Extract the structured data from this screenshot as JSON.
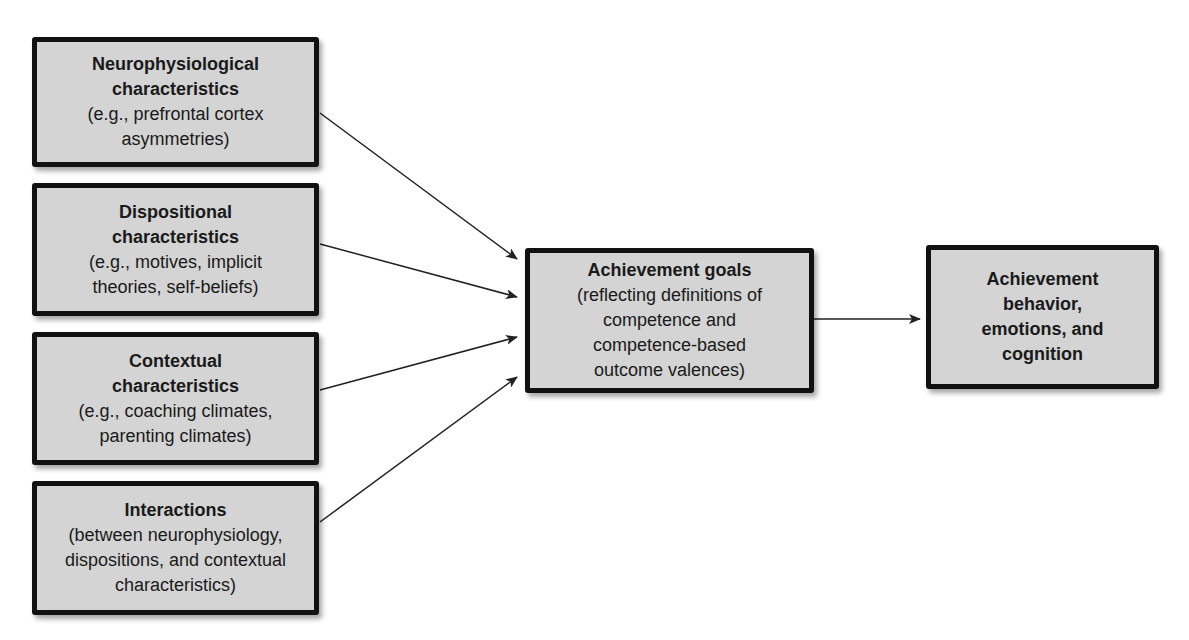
{
  "diagram": {
    "inputs": [
      {
        "title": "Neurophysiological\ncharacteristics",
        "description": "(e.g., prefrontal cortex\nasymmetries)"
      },
      {
        "title": "Dispositional\ncharacteristics",
        "description": "(e.g., motives, implicit\ntheories, self-beliefs)"
      },
      {
        "title": "Contextual\ncharacteristics",
        "description": "(e.g., coaching climates,\nparenting climates)"
      },
      {
        "title": "Interactions",
        "description": "(between neurophysiology,\ndispositions, and contextual\ncharacteristics)"
      }
    ],
    "center": {
      "title": "Achievement goals",
      "description": "(reflecting definitions of\ncompetence and\ncompetence-based\noutcome valences)"
    },
    "output": {
      "title": "Achievement\nbehavior,\nemotions, and\ncognition"
    },
    "edges": [
      {
        "from": "inputs.0",
        "to": "center"
      },
      {
        "from": "inputs.1",
        "to": "center"
      },
      {
        "from": "inputs.2",
        "to": "center"
      },
      {
        "from": "inputs.3",
        "to": "center"
      },
      {
        "from": "center",
        "to": "output"
      }
    ],
    "colors": {
      "box_fill": "#d4d4d4",
      "box_border": "#111111",
      "arrow": "#222222",
      "background": "#ffffff"
    }
  }
}
